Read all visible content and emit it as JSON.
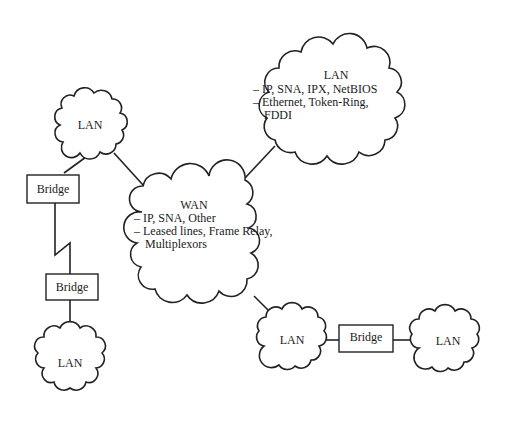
{
  "diagram": {
    "nodes": {
      "lan_top_right": {
        "title": "LAN",
        "items": [
          "– IP, SNA, IPX, NetBIOS",
          "– Ethernet, Token-Ring,",
          "FDDI"
        ]
      },
      "lan_top_left": {
        "title": "LAN"
      },
      "wan": {
        "title": "WAN",
        "items": [
          "– IP, SNA, Other",
          "– Leased lines, Frame Relay,",
          "Multiplexors"
        ]
      },
      "lan_bottom_left": {
        "title": "LAN"
      },
      "lan_bottom_mid": {
        "title": "LAN"
      },
      "lan_bottom_right": {
        "title": "LAN"
      },
      "bridge_left_upper": {
        "label": "Bridge"
      },
      "bridge_left_lower": {
        "label": "Bridge"
      },
      "bridge_bottom": {
        "label": "Bridge"
      }
    },
    "connections": [
      [
        "lan_top_left",
        "bridge_left_upper"
      ],
      [
        "bridge_left_upper",
        "bridge_left_lower",
        "serial-link"
      ],
      [
        "bridge_left_lower",
        "lan_bottom_left"
      ],
      [
        "lan_top_left",
        "wan"
      ],
      [
        "wan",
        "lan_top_right"
      ],
      [
        "wan",
        "lan_bottom_mid"
      ],
      [
        "lan_bottom_mid",
        "bridge_bottom"
      ],
      [
        "bridge_bottom",
        "lan_bottom_right"
      ]
    ]
  }
}
